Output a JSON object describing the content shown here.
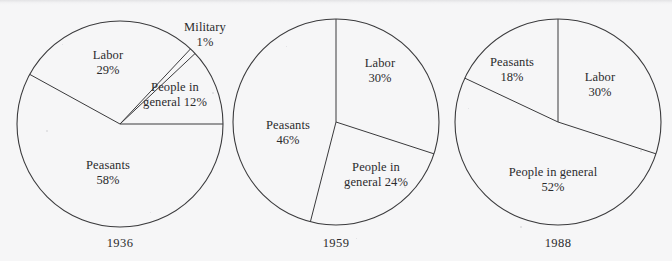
{
  "figure": {
    "background_color": "#f6f6f7",
    "line_color": "#3a3a3c",
    "text_color": "#2b2b2d"
  },
  "chart_data": [
    {
      "type": "pie",
      "title": "1936",
      "categories": [
        "Labor",
        "Military",
        "People in general",
        "Peasants"
      ],
      "values": [
        29,
        1,
        12,
        58
      ],
      "labels": [
        "Labor 29%",
        "Military 1%",
        "People in general 12%",
        "Peasants 58%"
      ],
      "legend": "none",
      "grid": false,
      "slices": [
        {
          "name": "People in general",
          "pct": 12,
          "label_line1": "People in",
          "label_line2": "general 12%",
          "start_deg": 0,
          "end_deg": 43.2,
          "label_x": 175,
          "label_y": 80,
          "inside": true
        },
        {
          "name": "Military",
          "pct": 1,
          "label_line1": "Military",
          "label_line2": "1%",
          "start_deg": 43.2,
          "end_deg": 46.8,
          "label_x": 205,
          "label_y": 20,
          "inside": false
        },
        {
          "name": "Labor",
          "pct": 29,
          "label_line1": "Labor",
          "label_line2": "29%",
          "start_deg": 46.8,
          "end_deg": 151.2,
          "label_x": 108,
          "label_y": 48,
          "inside": true
        },
        {
          "name": "Peasants",
          "pct": 58,
          "label_line1": "Peasants",
          "label_line2": "58%",
          "start_deg": 151.2,
          "end_deg": 360,
          "label_x": 108,
          "label_y": 158,
          "inside": true
        }
      ]
    },
    {
      "type": "pie",
      "title": "1959",
      "categories": [
        "Labor",
        "People in general",
        "Peasants"
      ],
      "values": [
        30,
        24,
        46
      ],
      "labels": [
        "Labor 30%",
        "People in general 24%",
        "Peasants 46%"
      ],
      "legend": "none",
      "grid": false,
      "slices": [
        {
          "name": "Labor",
          "pct": 30,
          "label_line1": "Labor",
          "label_line2": "30%",
          "start_deg": 90,
          "end_deg": -18,
          "label_x": 380,
          "label_y": 56,
          "inside": true
        },
        {
          "name": "People in general",
          "pct": 24,
          "label_line1": "People in",
          "label_line2": "general 24%",
          "start_deg": -18,
          "end_deg": -104.4,
          "label_x": 376,
          "label_y": 160,
          "inside": true
        },
        {
          "name": "Peasants",
          "pct": 46,
          "label_line1": "Peasants",
          "label_line2": "46%",
          "start_deg": -104.4,
          "end_deg": -270,
          "label_x": 288,
          "label_y": 118,
          "inside": true
        }
      ]
    },
    {
      "type": "pie",
      "title": "1988",
      "categories": [
        "Labor",
        "People in general",
        "Peasants"
      ],
      "values": [
        30,
        52,
        18
      ],
      "labels": [
        "Labor 30%",
        "People in general 52%",
        "Peasants 18%"
      ],
      "legend": "none",
      "grid": false,
      "slices": [
        {
          "name": "Labor",
          "pct": 30,
          "label_line1": "Labor",
          "label_line2": "30%",
          "start_deg": 90,
          "end_deg": -18,
          "label_x": 600,
          "label_y": 70,
          "inside": true
        },
        {
          "name": "People in general",
          "pct": 52,
          "label_line1": "People in general",
          "label_line2": "52%",
          "start_deg": -18,
          "end_deg": -205.2,
          "label_x": 553,
          "label_y": 165,
          "inside": true
        },
        {
          "name": "Peasants",
          "pct": 18,
          "label_line1": "Peasants",
          "label_line2": "18%",
          "start_deg": -205.2,
          "end_deg": -270,
          "label_x": 512,
          "label_y": 55,
          "inside": true
        }
      ]
    }
  ],
  "pies": [
    {
      "cx": 120,
      "cy": 124,
      "r": 103,
      "year": "1936",
      "year_x": 120,
      "year_y": 236
    },
    {
      "cx": 336,
      "cy": 122,
      "r": 103,
      "year": "1959",
      "year_x": 336,
      "year_y": 236
    },
    {
      "cx": 558,
      "cy": 122,
      "r": 103,
      "year": "1988",
      "year_x": 558,
      "year_y": 236
    }
  ]
}
